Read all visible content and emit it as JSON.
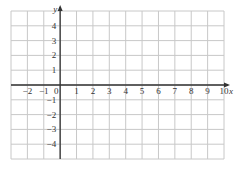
{
  "grid": {
    "x_min": -3,
    "x_max": 10,
    "y_min": -5,
    "y_max": 5,
    "left_px": 11,
    "right_px": 224,
    "top_px": 11,
    "bottom_px": 159,
    "grid_color": "#c8c8c8",
    "axis_color": "#333333"
  },
  "axes": {
    "x_label": "x",
    "y_label": "y",
    "x_ticks": [
      "−2",
      "−1",
      "0",
      "1",
      "2",
      "3",
      "4",
      "5",
      "6",
      "7",
      "8",
      "9",
      "10"
    ],
    "x_tick_values": [
      -2,
      -1,
      0,
      1,
      2,
      3,
      4,
      5,
      6,
      7,
      8,
      9,
      10
    ],
    "y_ticks": [
      "4",
      "3",
      "2",
      "1",
      "−1",
      "−2",
      "−3",
      "−4"
    ],
    "y_tick_values": [
      4,
      3,
      2,
      1,
      -1,
      -2,
      -3,
      -4
    ]
  }
}
